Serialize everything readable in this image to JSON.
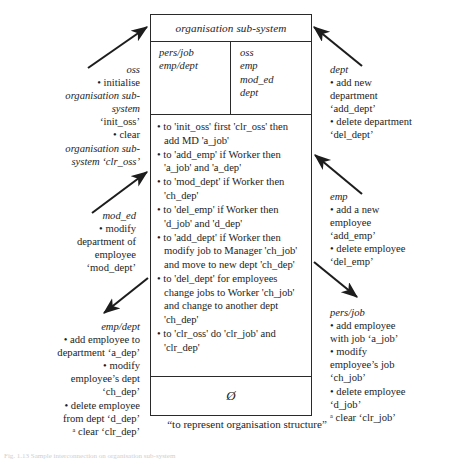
{
  "diagram": {
    "title": "organisation sub-system",
    "ports_left": [
      "pers/job",
      "emp/dept"
    ],
    "ports_right": [
      "oss",
      "emp",
      "mod_ed",
      "dept"
    ],
    "rules": [
      "to 'init_oss' first 'clr_oss' then add MD 'a_job'",
      "to 'add_emp' if Worker then 'a_job' and 'a_dep'",
      "to 'mod_dept' if Worker then 'ch_dep'",
      "to 'del_emp' if Worker then 'd_job' and 'd_dep'",
      "to 'add_dept' if Worker then modify job to Manager 'ch_job' and move to new dept 'ch_dep'",
      "to 'del_dept' for employees change jobs to Worker 'ch_job' and change to another dept 'ch_dep'",
      "to 'clr_oss' do 'clr_job' and 'clr_dep'"
    ],
    "footer_symbol": "Ø",
    "caption": "“to represent organisation structure”",
    "bottom_note": "Fig. 1.13  Sample interconnection on organisation sub-system"
  },
  "annotations": {
    "oss": {
      "head": "oss",
      "lines": [
        "• initialise",
        "organisation sub-",
        "system",
        "‘init_oss’",
        "• clear",
        "organisation sub-",
        "system ‘clr_oss’"
      ]
    },
    "mod_ed": {
      "head": "mod_ed",
      "lines": [
        "• modify",
        "department of",
        "employee",
        "‘mod_dept’"
      ]
    },
    "emp_dept": {
      "head": "emp/dept",
      "lines": [
        "• add employee to",
        "department ‘a_dep’",
        "• modify",
        "employee’s dept",
        "‘ch_dep’",
        "• delete employee",
        "from dept ‘d_dep’",
        "ᵃ clear ‘clr_dep’"
      ]
    },
    "dept": {
      "head": "dept",
      "lines": [
        "• add new",
        "department",
        "‘add_dept’",
        "• delete department",
        "‘del_dept’"
      ]
    },
    "emp": {
      "head": "emp",
      "lines": [
        "• add a new",
        "employee",
        "‘add_emp’",
        "• delete employee",
        "‘del_emp’"
      ]
    },
    "pers_job": {
      "head": "pers/job",
      "lines": [
        "• add employee",
        "with job ‘a_job’",
        "• modify",
        "employee’s job",
        "‘ch_job’",
        "• delete employee",
        "‘d_job’",
        "ᵃ clear ‘clr_job’"
      ]
    }
  },
  "colors": {
    "ink": "#1d1d1d",
    "rule": "#2a2a2a",
    "paper": "#ffffff"
  }
}
